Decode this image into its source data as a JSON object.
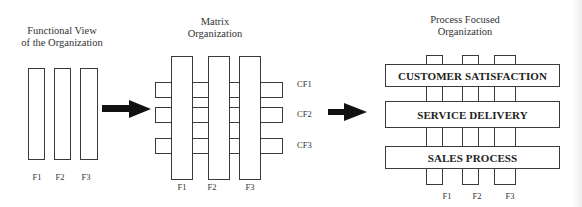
{
  "diagram": {
    "functional": {
      "title_line1": "Functional View",
      "title_line2": "of the Organization",
      "functions": [
        "F1",
        "F2",
        "F3"
      ]
    },
    "matrix": {
      "title_line1": "Matrix",
      "title_line2": "Organization",
      "functions": [
        "F1",
        "F2",
        "F3"
      ],
      "cross_functions": [
        "CF1",
        "CF2",
        "CF3"
      ]
    },
    "process": {
      "title_line1": "Process Focused",
      "title_line2": "Organization",
      "functions": [
        "F1",
        "F2",
        "F3"
      ],
      "processes": [
        "CUSTOMER SATISFACTION",
        "SERVICE DELIVERY",
        "SALES PROCESS"
      ]
    },
    "arrows": [
      "arrow-functional-to-matrix",
      "arrow-matrix-to-process"
    ],
    "colors": {
      "line": "#3a3a3a",
      "arrow": "#111111",
      "background": "#ffffff"
    }
  }
}
